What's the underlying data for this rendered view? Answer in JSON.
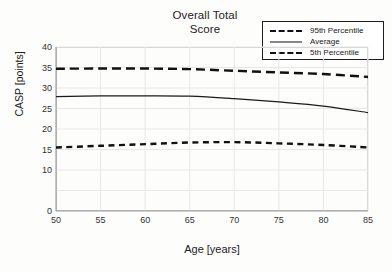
{
  "chart_data": {
    "type": "line",
    "title": "Overall Total\nScore",
    "xlabel": "Age [years]",
    "ylabel": "CASP [points]",
    "xlim": [
      50,
      85
    ],
    "ylim": [
      0,
      40
    ],
    "grid": true,
    "legend_position": "top-right",
    "xticks": [
      "50",
      "55",
      "60",
      "65",
      "70",
      "75",
      "80",
      "85"
    ],
    "yticks": [
      "0",
      "10",
      "15",
      "20",
      "25",
      "30",
      "35",
      "40"
    ],
    "ytick_values": [
      0,
      10,
      15,
      20,
      25,
      30,
      35,
      40
    ],
    "xtick_values": [
      50,
      55,
      60,
      65,
      70,
      75,
      80,
      85
    ],
    "x": [
      50,
      55,
      60,
      65,
      70,
      75,
      80,
      85
    ],
    "series": [
      {
        "name": "95th Percentile",
        "style": "dashed-long",
        "color": "#111111",
        "values": [
          34.7,
          34.75,
          34.75,
          34.6,
          34.2,
          33.8,
          33.4,
          32.7
        ]
      },
      {
        "name": "Average",
        "style": "solid",
        "color": "#1a1a1a",
        "values": [
          27.9,
          28.1,
          28.1,
          28.0,
          27.4,
          26.6,
          25.6,
          24.0
        ]
      },
      {
        "name": "5th Percentile",
        "style": "dashed-short",
        "color": "#111111",
        "values": [
          15.5,
          15.9,
          16.3,
          16.7,
          16.8,
          16.5,
          16.1,
          15.5
        ]
      }
    ]
  },
  "legend": {
    "items": [
      {
        "label": "95th Percentile"
      },
      {
        "label": "Average"
      },
      {
        "label": "5th Percentile"
      }
    ]
  }
}
